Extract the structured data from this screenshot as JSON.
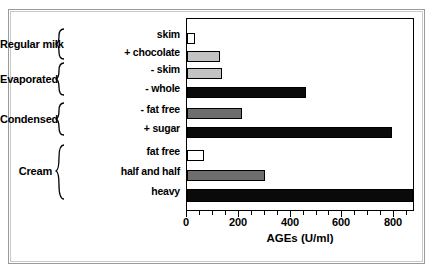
{
  "chart_data": {
    "type": "bar",
    "orientation": "horizontal",
    "title": "",
    "xlabel": "AGEs (U/ml)",
    "ylabel": "",
    "xlim": [
      0,
      880
    ],
    "xticks": [
      0,
      200,
      400,
      600,
      800
    ],
    "xtick_labels": [
      "0",
      "200",
      "400",
      "600",
      "800"
    ],
    "minor_tick_interval": 50,
    "grid": false,
    "legend": false,
    "categories": [
      "skim",
      "+ chocolate",
      "- skim",
      "- whole",
      "- fat free",
      "+ sugar",
      "fat free",
      "half and half",
      "heavy"
    ],
    "values": [
      30,
      130,
      135,
      465,
      215,
      800,
      65,
      305,
      880
    ],
    "bar_fills": [
      "white",
      "light",
      "light",
      "black",
      "dark",
      "black",
      "white",
      "dark",
      "black"
    ],
    "groups": [
      {
        "label": "Regular milk",
        "items": [
          "skim",
          "+ chocolate"
        ]
      },
      {
        "label": "Evaporated",
        "items": [
          "- skim",
          "- whole"
        ]
      },
      {
        "label": "Condensed",
        "items": [
          "- fat free",
          "+ sugar"
        ]
      },
      {
        "label": "Cream",
        "items": [
          "fat free",
          "half and half",
          "heavy"
        ]
      }
    ]
  },
  "group_labels": {
    "regular_milk": "Regular milk",
    "evaporated": "Evaporated",
    "condensed": "Condensed",
    "cream": "Cream"
  },
  "series_labels": {
    "skim": "skim",
    "chocolate": "+ chocolate",
    "evap_skim": "- skim",
    "evap_whole": "- whole",
    "cond_fat_free": "- fat free",
    "cond_sugar": "+ sugar",
    "cream_fat_free": "fat free",
    "half_and_half": "half and half",
    "heavy": "heavy"
  },
  "axis": {
    "label": "AGEs (U/ml)",
    "tick_0": "0",
    "tick_200": "200",
    "tick_400": "400",
    "tick_600": "600",
    "tick_800": "800"
  },
  "colors": {
    "white": "#ffffff",
    "light_gray": "#c3c3c3",
    "medium_gray": "#9a9a9a",
    "dark_gray": "#6e6e6e",
    "black": "#0a0a0a",
    "frame": "#9a9a9a"
  }
}
